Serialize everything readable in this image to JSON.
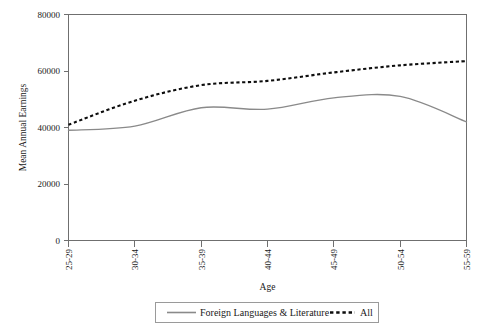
{
  "chart_data": {
    "type": "line",
    "title": "",
    "xlabel": "Age",
    "ylabel": "Mean Annual Earnings",
    "categories": [
      "25-29",
      "30-34",
      "35-39",
      "40-44",
      "45-49",
      "50-54",
      "55-59"
    ],
    "ylim": [
      0,
      80000
    ],
    "yticks": [
      0,
      20000,
      40000,
      60000,
      80000
    ],
    "ytick_labels": [
      "0",
      "20000",
      "40000",
      "60000",
      "80000"
    ],
    "grid": false,
    "legend_position": "bottom",
    "series": [
      {
        "name": "Foreign Languages & Literature",
        "style": "solid",
        "color": "#8a8a8a",
        "values": [
          39000,
          40500,
          47000,
          46500,
          50500,
          51000,
          42000
        ]
      },
      {
        "name": "All",
        "style": "dashed",
        "color": "#0d0d0d",
        "values": [
          41000,
          49500,
          55000,
          56500,
          59500,
          62000,
          63500
        ]
      }
    ]
  },
  "axes": {
    "y_title": "Mean Annual Earnings",
    "x_title": "Age",
    "y_tick_0": "0",
    "y_tick_1": "20000",
    "y_tick_2": "40000",
    "y_tick_3": "60000",
    "y_tick_4": "80000",
    "x_tick_0": "25-29",
    "x_tick_1": "30-34",
    "x_tick_2": "35-39",
    "x_tick_3": "40-44",
    "x_tick_4": "45-49",
    "x_tick_5": "50-54",
    "x_tick_6": "55-59"
  },
  "legend": {
    "entry_0_label": "Foreign Languages & Literature",
    "entry_1_label": "All"
  },
  "colors": {
    "series_solid": "#8a8a8a",
    "series_dashed": "#0d0d0d",
    "axis": "#6f6f6f",
    "text": "#1a1a1a",
    "background": "#ffffff"
  }
}
